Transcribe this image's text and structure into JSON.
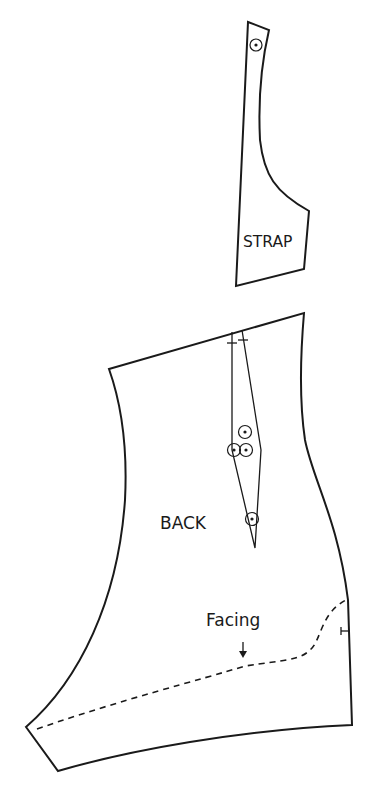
{
  "diagram": {
    "type": "sewing-pattern",
    "pieces": [
      {
        "id": "strap",
        "label": "STRAP"
      },
      {
        "id": "back",
        "label": "BACK",
        "annotation": "Facing"
      }
    ],
    "colors": {
      "line": "#1a1a1a",
      "background": "#ffffff"
    }
  }
}
